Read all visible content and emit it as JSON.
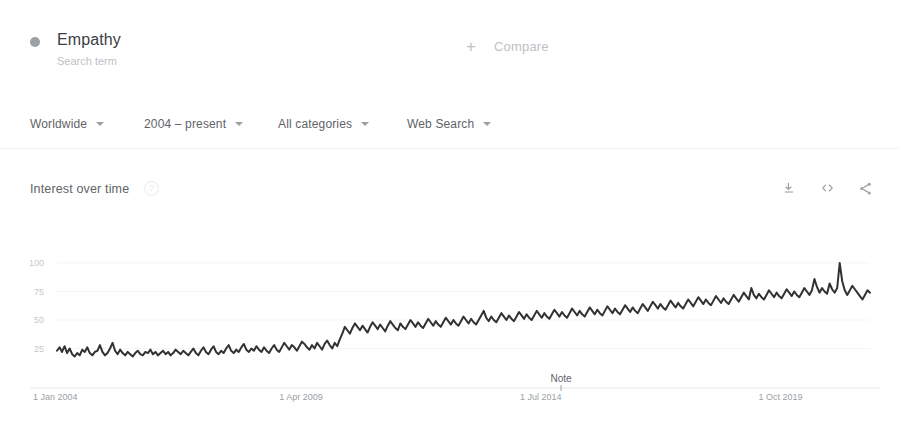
{
  "term": {
    "name": "Empathy",
    "subtitle": "Search term",
    "dot_color": "#9aa0a6"
  },
  "compare": {
    "plus": "+",
    "label": "Compare"
  },
  "filters": [
    {
      "id": "region",
      "label": "Worldwide"
    },
    {
      "id": "time",
      "label": "2004 – present"
    },
    {
      "id": "category",
      "label": "All categories"
    },
    {
      "id": "search_type",
      "label": "Web Search"
    }
  ],
  "section": {
    "title": "Interest over time",
    "help_icon": "?",
    "actions": [
      {
        "id": "download",
        "icon": "download-icon"
      },
      {
        "id": "embed",
        "icon": "embed-code-icon"
      },
      {
        "id": "share",
        "icon": "share-icon"
      }
    ]
  },
  "chart_data": {
    "type": "line",
    "title": "Interest over time",
    "xlabel": "",
    "ylabel": "",
    "ylim": [
      0,
      100
    ],
    "yticks": [
      25,
      50,
      75,
      100
    ],
    "grid": true,
    "legend": false,
    "line_color": "#323232",
    "annotation": {
      "label": "Note",
      "x_fraction": 0.62
    },
    "xticks": [
      {
        "label": "1 Jan 2004",
        "x_fraction": 0.0
      },
      {
        "label": "1 Apr 2009",
        "x_fraction": 0.3
      },
      {
        "label": "1 Jul 2014",
        "x_fraction": 0.595
      },
      {
        "label": "1 Oct 2019",
        "x_fraction": 0.89
      }
    ],
    "series": [
      {
        "name": "Empathy",
        "values": [
          23,
          26,
          22,
          27,
          21,
          25,
          20,
          18,
          21,
          19,
          24,
          22,
          26,
          21,
          19,
          22,
          23,
          28,
          22,
          19,
          21,
          25,
          30,
          23,
          20,
          24,
          21,
          19,
          22,
          20,
          18,
          21,
          23,
          20,
          19,
          22,
          21,
          24,
          20,
          22,
          19,
          21,
          23,
          20,
          22,
          19,
          21,
          24,
          22,
          20,
          23,
          21,
          19,
          22,
          25,
          21,
          19,
          23,
          26,
          22,
          20,
          24,
          27,
          22,
          20,
          23,
          21,
          25,
          28,
          23,
          21,
          24,
          22,
          26,
          29,
          24,
          22,
          25,
          23,
          27,
          24,
          22,
          26,
          23,
          21,
          25,
          28,
          24,
          22,
          26,
          30,
          27,
          24,
          28,
          26,
          23,
          27,
          31,
          29,
          26,
          24,
          28,
          25,
          30,
          27,
          24,
          29,
          32,
          28,
          25,
          30,
          27,
          33,
          38,
          44,
          41,
          38,
          43,
          47,
          44,
          41,
          45,
          42,
          39,
          44,
          48,
          45,
          42,
          46,
          43,
          40,
          45,
          49,
          46,
          43,
          41,
          47,
          44,
          42,
          46,
          50,
          47,
          44,
          48,
          45,
          43,
          47,
          51,
          48,
          45,
          49,
          46,
          44,
          48,
          52,
          49,
          46,
          50,
          47,
          45,
          49,
          53,
          50,
          47,
          51,
          48,
          46,
          50,
          54,
          58,
          52,
          49,
          53,
          50,
          48,
          52,
          56,
          53,
          50,
          54,
          51,
          49,
          53,
          57,
          54,
          51,
          55,
          52,
          50,
          54,
          58,
          55,
          52,
          56,
          53,
          51,
          55,
          59,
          56,
          53,
          57,
          54,
          52,
          56,
          60,
          57,
          54,
          58,
          55,
          53,
          57,
          61,
          58,
          55,
          59,
          56,
          54,
          58,
          62,
          59,
          56,
          60,
          57,
          55,
          59,
          63,
          60,
          57,
          61,
          58,
          56,
          60,
          64,
          61,
          58,
          62,
          66,
          63,
          60,
          64,
          61,
          59,
          63,
          67,
          64,
          61,
          65,
          62,
          60,
          64,
          68,
          65,
          62,
          66,
          70,
          67,
          64,
          68,
          65,
          63,
          67,
          71,
          68,
          65,
          69,
          66,
          64,
          68,
          72,
          69,
          66,
          70,
          74,
          71,
          68,
          78,
          72,
          69,
          73,
          70,
          68,
          72,
          76,
          73,
          70,
          74,
          71,
          69,
          73,
          77,
          74,
          71,
          75,
          72,
          70,
          74,
          78,
          75,
          72,
          76,
          86,
          79,
          74,
          78,
          75,
          73,
          82,
          77,
          74,
          78,
          100,
          84,
          76,
          72,
          76,
          80,
          77,
          74,
          71,
          68,
          72,
          76,
          74
        ]
      }
    ]
  }
}
